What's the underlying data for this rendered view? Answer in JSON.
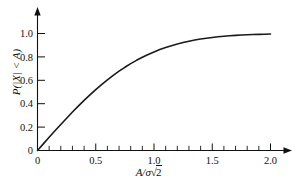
{
  "chart_data": {
    "type": "line",
    "title": "",
    "xlabel": "A/σ √2",
    "ylabel": "P(|X| < A)",
    "xlim": [
      0,
      2.15
    ],
    "ylim": [
      0,
      1.08
    ],
    "grid": false,
    "legend": "none",
    "xticks": [
      0,
      0.5,
      1.0,
      1.5,
      2.0
    ],
    "xticklabels": [
      "0",
      "0.5",
      "1.0",
      "1.5",
      "2.0"
    ],
    "xminor_step": 0.1,
    "yticks": [
      0,
      0.2,
      0.4,
      0.6,
      0.8,
      1.0
    ],
    "yticklabels": [
      "0",
      "0.2",
      "0.4",
      "0.6",
      "0.8",
      "1.0"
    ],
    "series": [
      {
        "name": "erf(A/σ√2)",
        "x": [
          0.0,
          0.05,
          0.1,
          0.15,
          0.2,
          0.25,
          0.3,
          0.35,
          0.4,
          0.45,
          0.5,
          0.55,
          0.6,
          0.65,
          0.7,
          0.75,
          0.8,
          0.85,
          0.9,
          0.95,
          1.0,
          1.05,
          1.1,
          1.15,
          1.2,
          1.25,
          1.3,
          1.35,
          1.4,
          1.45,
          1.5,
          1.55,
          1.6,
          1.65,
          1.7,
          1.75,
          1.8,
          1.85,
          1.9,
          1.95,
          2.0
        ],
        "y": [
          0.0,
          0.0564,
          0.1125,
          0.168,
          0.2227,
          0.2763,
          0.3286,
          0.3794,
          0.4284,
          0.4755,
          0.5205,
          0.5633,
          0.6039,
          0.642,
          0.6778,
          0.7112,
          0.7421,
          0.7707,
          0.7969,
          0.8209,
          0.8427,
          0.8624,
          0.8802,
          0.8961,
          0.9103,
          0.9229,
          0.934,
          0.9438,
          0.9523,
          0.9597,
          0.9661,
          0.9716,
          0.9763,
          0.9804,
          0.9838,
          0.9867,
          0.9891,
          0.9911,
          0.9928,
          0.9942,
          0.9953
        ]
      }
    ]
  },
  "axes": {
    "x_tick_labels": [
      "0",
      "0.5",
      "1.0",
      "1.5",
      "2.0"
    ],
    "y_tick_labels": [
      "0",
      "0.2",
      "0.4",
      "0.6",
      "0.8",
      "1.0"
    ],
    "y_origin_label": "0",
    "x_axis_label_main": "A/σ",
    "x_axis_label_radical": "√",
    "x_axis_label_radicand": "2",
    "y_axis_label": "P(|X| < A)"
  }
}
